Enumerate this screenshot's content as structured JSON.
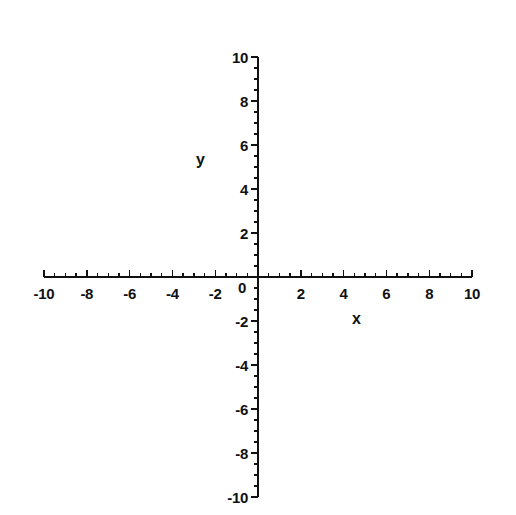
{
  "chart_data": {
    "type": "scatter",
    "title": "",
    "subtitle": "",
    "xlabel": "x",
    "ylabel": "y",
    "xlim": [
      -10,
      10
    ],
    "ylim": [
      -10,
      10
    ],
    "grid": false,
    "legend": null,
    "series": [],
    "annotations": [],
    "x_tick_labels": [
      "-10",
      "-8",
      "-6",
      "-4",
      "-2",
      "0",
      "2",
      "4",
      "6",
      "8",
      "10"
    ],
    "x_tick_values": [
      -10,
      -8,
      -6,
      -4,
      -2,
      0,
      2,
      4,
      6,
      8,
      10
    ],
    "y_tick_labels": [
      "10",
      "8",
      "6",
      "4",
      "2",
      "0",
      "-2",
      "-4",
      "-6",
      "-8",
      "-10"
    ],
    "y_tick_values": [
      10,
      8,
      6,
      4,
      2,
      0,
      -2,
      -4,
      -6,
      -8,
      -10
    ],
    "minor_tick_step": 0.5,
    "major_tick_step": 2,
    "axis_color": "#111111",
    "background_color": "#ffffff"
  },
  "axes": {
    "x_axis_name": "x",
    "y_axis_name": "y",
    "origin_label": "0"
  },
  "geometry": {
    "origin_x_px": 258,
    "origin_y_px": 277,
    "px_per_unit_x": 21.4,
    "px_per_unit_y": 22.0,
    "major_tick_len_px": 7,
    "minor_tick_len_px": 4,
    "axis_stroke_px": 1.6
  }
}
